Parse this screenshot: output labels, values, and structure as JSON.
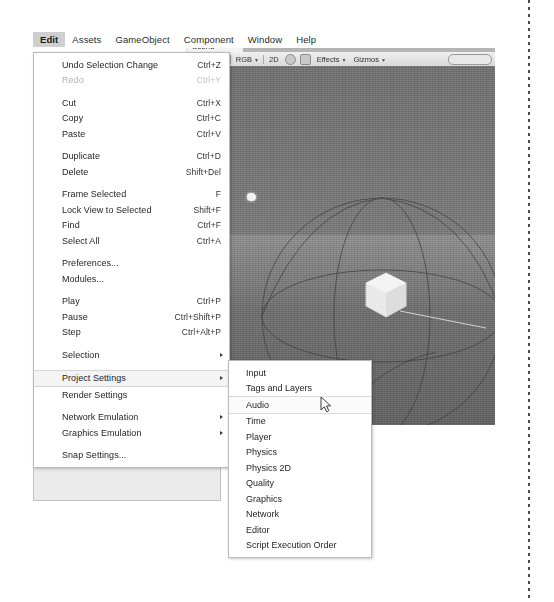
{
  "app": {
    "name": "Unity Editor",
    "menubar": [
      {
        "label": "Edit",
        "active": true
      },
      {
        "label": "Assets",
        "active": false
      },
      {
        "label": "GameObject",
        "active": false
      },
      {
        "label": "Component",
        "active": false
      },
      {
        "label": "Window",
        "active": false
      },
      {
        "label": "Help",
        "active": false
      }
    ]
  },
  "scene_view": {
    "tab_label": "Scene",
    "toolbar": {
      "draw_mode": "Textured",
      "color_mode": "RGB",
      "view_mode_2d": "2D",
      "lighting_icon": "lightbulb-icon",
      "audio_icon": "speaker-icon",
      "effects": "Effects",
      "gizmos": "Gizmos",
      "caret": "▾",
      "search_placeholder": ""
    },
    "objects": [
      "directional-light-gizmo",
      "cube-object",
      "wireframe-sphere-gizmo"
    ]
  },
  "edit_menu": {
    "title": "Edit",
    "items": [
      {
        "label": "Undo Selection Change",
        "shortcut": "Ctrl+Z",
        "disabled": false,
        "submenu": false,
        "highlighted": false
      },
      {
        "label": "Redo",
        "shortcut": "Ctrl+Y",
        "disabled": true,
        "submenu": false,
        "highlighted": false
      },
      {
        "separator": true
      },
      {
        "label": "Cut",
        "shortcut": "Ctrl+X",
        "disabled": false,
        "submenu": false,
        "highlighted": false
      },
      {
        "label": "Copy",
        "shortcut": "Ctrl+C",
        "disabled": false,
        "submenu": false,
        "highlighted": false
      },
      {
        "label": "Paste",
        "shortcut": "Ctrl+V",
        "disabled": false,
        "submenu": false,
        "highlighted": false
      },
      {
        "separator": true
      },
      {
        "label": "Duplicate",
        "shortcut": "Ctrl+D",
        "disabled": false,
        "submenu": false,
        "highlighted": false
      },
      {
        "label": "Delete",
        "shortcut": "Shift+Del",
        "disabled": false,
        "submenu": false,
        "highlighted": false
      },
      {
        "separator": true
      },
      {
        "label": "Frame Selected",
        "shortcut": "F",
        "disabled": false,
        "submenu": false,
        "highlighted": false
      },
      {
        "label": "Lock View to Selected",
        "shortcut": "Shift+F",
        "disabled": false,
        "submenu": false,
        "highlighted": false
      },
      {
        "label": "Find",
        "shortcut": "Ctrl+F",
        "disabled": false,
        "submenu": false,
        "highlighted": false
      },
      {
        "label": "Select All",
        "shortcut": "Ctrl+A",
        "disabled": false,
        "submenu": false,
        "highlighted": false
      },
      {
        "separator": true
      },
      {
        "label": "Preferences...",
        "shortcut": "",
        "disabled": false,
        "submenu": false,
        "highlighted": false
      },
      {
        "label": "Modules...",
        "shortcut": "",
        "disabled": false,
        "submenu": false,
        "highlighted": false
      },
      {
        "separator": true
      },
      {
        "label": "Play",
        "shortcut": "Ctrl+P",
        "disabled": false,
        "submenu": false,
        "highlighted": false
      },
      {
        "label": "Pause",
        "shortcut": "Ctrl+Shift+P",
        "disabled": false,
        "submenu": false,
        "highlighted": false
      },
      {
        "label": "Step",
        "shortcut": "Ctrl+Alt+P",
        "disabled": false,
        "submenu": false,
        "highlighted": false
      },
      {
        "separator": true
      },
      {
        "label": "Selection",
        "shortcut": "",
        "disabled": false,
        "submenu": true,
        "highlighted": false
      },
      {
        "separator": true
      },
      {
        "label": "Project Settings",
        "shortcut": "",
        "disabled": false,
        "submenu": true,
        "highlighted": true
      },
      {
        "label": "Render Settings",
        "shortcut": "",
        "disabled": false,
        "submenu": false,
        "highlighted": false
      },
      {
        "separator": true
      },
      {
        "label": "Network Emulation",
        "shortcut": "",
        "disabled": false,
        "submenu": true,
        "highlighted": false
      },
      {
        "label": "Graphics Emulation",
        "shortcut": "",
        "disabled": false,
        "submenu": true,
        "highlighted": false
      },
      {
        "separator": true
      },
      {
        "label": "Snap Settings...",
        "shortcut": "",
        "disabled": false,
        "submenu": false,
        "highlighted": false
      }
    ]
  },
  "project_settings_submenu": {
    "parent": "Project Settings",
    "items": [
      {
        "label": "Input",
        "highlighted": false
      },
      {
        "label": "Tags and Layers",
        "highlighted": false
      },
      {
        "label": "Audio",
        "highlighted": true
      },
      {
        "label": "Time",
        "highlighted": false
      },
      {
        "label": "Player",
        "highlighted": false
      },
      {
        "label": "Physics",
        "highlighted": false
      },
      {
        "label": "Physics 2D",
        "highlighted": false
      },
      {
        "label": "Quality",
        "highlighted": false
      },
      {
        "label": "Graphics",
        "highlighted": false
      },
      {
        "label": "Network",
        "highlighted": false
      },
      {
        "label": "Editor",
        "highlighted": false
      },
      {
        "label": "Script Execution Order",
        "highlighted": false
      }
    ]
  },
  "cursor": {
    "icon": "mouse-pointer-icon"
  },
  "colors": {
    "menu_bg": "#ffffff",
    "menu_border": "#b9b9b9",
    "highlight_bg": "#f4f4f4",
    "disabled_text": "#b3b3b3",
    "text": "#242424",
    "panel_bg": "#ebebeb",
    "viewport_bg": "#6e6e6e"
  }
}
